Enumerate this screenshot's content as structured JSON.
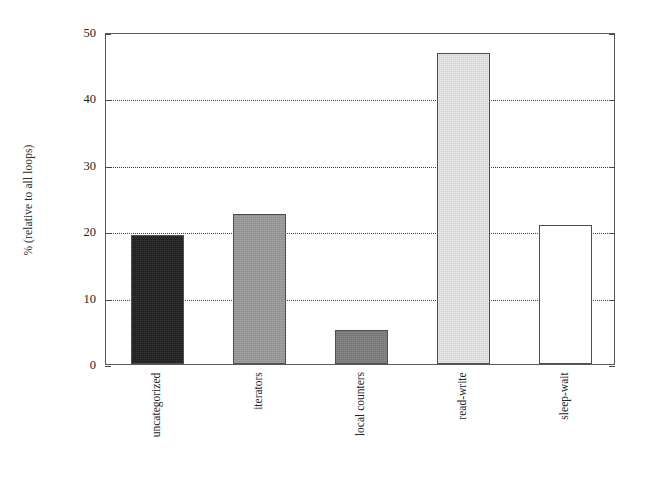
{
  "chart_data": {
    "type": "bar",
    "title": "",
    "xlabel": "",
    "ylabel": "% (relative to all loops)",
    "categories": [
      "uncategorized",
      "iterators",
      "local counters",
      "read-write",
      "sleep-wait"
    ],
    "values": [
      19.4,
      22.6,
      5.1,
      46.9,
      21.0
    ],
    "ylim": [
      0,
      50
    ],
    "yticks": [
      0,
      10,
      20,
      30,
      40,
      50
    ],
    "ytick_labels": [
      "0",
      "10",
      "20",
      "30",
      "40",
      "50"
    ],
    "grid": true,
    "grid_axis": "y",
    "grid_style": "dotted",
    "legend": "none",
    "bar_colors": [
      "#1f1f1f",
      "#9c9c9c",
      "#7e7e7e",
      "#e9e9e9",
      "#ffffff"
    ],
    "bar_edge_color": "#4d4d4d",
    "frame_color": "#5a5a5a",
    "background": "#ffffff"
  },
  "axis": {
    "y_title": "% (relative to all loops)",
    "ticks": [
      {
        "label": "50",
        "value": 50
      },
      {
        "label": "40",
        "value": 40
      },
      {
        "label": "30",
        "value": 30
      },
      {
        "label": "20",
        "value": 20
      },
      {
        "label": "10",
        "value": 10
      },
      {
        "label": "0",
        "value": 0
      }
    ]
  },
  "bars": [
    {
      "label": "uncategorized",
      "value": 19.4,
      "color": "#1f1f1f"
    },
    {
      "label": "iterators",
      "value": 22.6,
      "color": "#9c9c9c"
    },
    {
      "label": "local counters",
      "value": 5.1,
      "color": "#7e7e7e"
    },
    {
      "label": "read-write",
      "value": 46.9,
      "color": "#e9e9e9"
    },
    {
      "label": "sleep-wait",
      "value": 21.0,
      "color": "#ffffff"
    }
  ]
}
